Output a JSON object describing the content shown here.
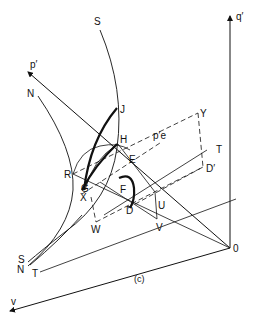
{
  "figure": {
    "caption": "(c)",
    "axes": {
      "q_prime": "q′",
      "p_prime": "p′",
      "v": "v",
      "origin": "0"
    },
    "points": {
      "S_top": "S",
      "N_top": "N",
      "J": "J",
      "H": "H",
      "pe": "p′e",
      "Y": "Y",
      "T_right": "T",
      "D_prime": "D′",
      "E": "E",
      "R": "R",
      "G": "G",
      "X": "X",
      "F": "F",
      "D": "D",
      "U": "U",
      "W": "W",
      "V": "V",
      "S_bottom": "S",
      "N_bottom": "N",
      "T_bottom": "T"
    },
    "colors": {
      "ink": "#111111",
      "background": "#ffffff"
    }
  }
}
